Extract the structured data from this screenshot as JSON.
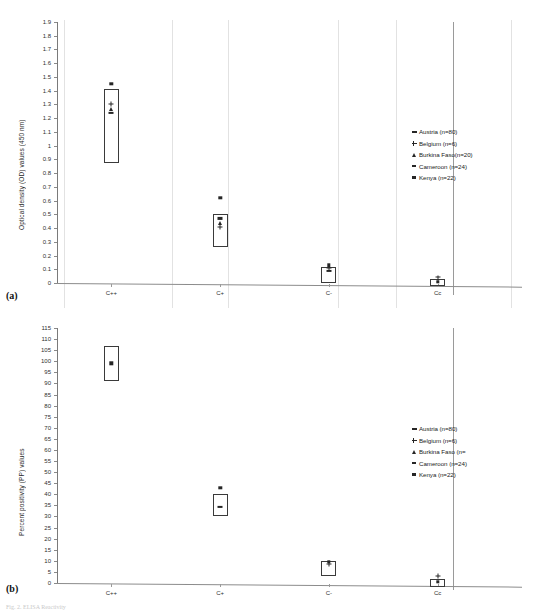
{
  "document": {
    "page_header": "",
    "caption": "Fig. 2. ELISA Reactivity"
  },
  "legend": {
    "entries": [
      {
        "label": "Austria (n=80)",
        "marker": "dash-bold",
        "marker_name": "austria-marker-icon"
      },
      {
        "label": "Belgium (n=6)",
        "marker": "plus",
        "marker_name": "belgium-marker-icon"
      },
      {
        "label": "Burkina Faso(n=20)",
        "marker": "triangle",
        "marker_name": "burkina-faso-marker-icon"
      },
      {
        "label": "Cameroon (n=24)",
        "marker": "dash",
        "marker_name": "cameroon-marker-icon"
      },
      {
        "label": "Kenya (n=22)",
        "marker": "square",
        "marker_name": "kenya-marker-icon"
      }
    ],
    "entries_b": [
      {
        "label": "Austria (n=80)",
        "marker": "dash-bold",
        "marker_name": "austria-marker-icon"
      },
      {
        "label": "Belgium (n=6)",
        "marker": "plus",
        "marker_name": "belgium-marker-icon"
      },
      {
        "label": "Burkina Faso (n=",
        "marker": "triangle",
        "marker_name": "burkina-faso-marker-icon"
      },
      {
        "label": "Cameroon (n=24)",
        "marker": "dash",
        "marker_name": "cameroon-marker-icon"
      },
      {
        "label": "Kenya (n=22)",
        "marker": "square",
        "marker_name": "kenya-marker-icon"
      }
    ]
  },
  "panel_a": {
    "letter": "(a)",
    "ylabel": "Optical density (OD) values (450 nm)"
  },
  "panel_b": {
    "letter": "(b)",
    "ylabel": "Percent positivity (PP) values"
  },
  "chart_data": [
    {
      "type": "box",
      "panel": "(a)",
      "title": "",
      "xlabel": "",
      "ylabel": "Optical density (OD) values (450 nm)",
      "categories": [
        "C++",
        "C+",
        "C-",
        "Cc"
      ],
      "ylim": [
        0,
        1.9
      ],
      "ytick_step": 0.1,
      "yticks": [
        0,
        0.1,
        0.2,
        0.3,
        0.4,
        0.5,
        0.6,
        0.7,
        0.8,
        0.9,
        1,
        1.1,
        1.2,
        1.3,
        1.4,
        1.5,
        1.6,
        1.7,
        1.8,
        1.9
      ],
      "grid": "vertical-only",
      "legend_position": "right",
      "boxes": [
        {
          "category": "C++",
          "low": 0.87,
          "high": 1.41
        },
        {
          "category": "C+",
          "low": 0.26,
          "high": 0.5
        },
        {
          "category": "C-",
          "low": 0.0,
          "high": 0.12
        },
        {
          "category": "Cc",
          "low": -0.02,
          "high": 0.03
        }
      ],
      "points": [
        {
          "category": "C++",
          "series": "Kenya (n=22)",
          "marker": "square",
          "value": 1.45
        },
        {
          "category": "C++",
          "series": "Belgium (n=6)",
          "marker": "plus",
          "value": 1.3
        },
        {
          "category": "C++",
          "series": "Burkina Faso(n=20)",
          "marker": "triangle",
          "value": 1.27
        },
        {
          "category": "C++",
          "series": "Austria (n=80)",
          "marker": "dash-bold",
          "value": 1.24
        },
        {
          "category": "C+",
          "series": "Kenya (n=22)",
          "marker": "square",
          "value": 0.62
        },
        {
          "category": "C+",
          "series": "Austria (n=80)",
          "marker": "dash-bold",
          "value": 0.47
        },
        {
          "category": "C+",
          "series": "Burkina Faso(n=20)",
          "marker": "triangle",
          "value": 0.44
        },
        {
          "category": "C+",
          "series": "Belgium (n=6)",
          "marker": "plus",
          "value": 0.41
        },
        {
          "category": "C-",
          "series": "Kenya (n=22)",
          "marker": "square",
          "value": 0.13
        },
        {
          "category": "C-",
          "series": "Belgium (n=6)",
          "marker": "plus",
          "value": 0.11
        },
        {
          "category": "C-",
          "series": "Austria (n=80)",
          "marker": "dash-bold",
          "value": 0.09
        },
        {
          "category": "Cc",
          "series": "Belgium (n=6)",
          "marker": "plus",
          "value": 0.04
        },
        {
          "category": "Cc",
          "series": "Kenya (n=22)",
          "marker": "square",
          "value": 0.01
        }
      ]
    },
    {
      "type": "box",
      "panel": "(b)",
      "title": "",
      "xlabel": "",
      "ylabel": "Percent positivity (PP) values",
      "categories": [
        "C++",
        "C+",
        "C-",
        "Cc"
      ],
      "ylim": [
        0,
        115
      ],
      "ytick_step": 5,
      "yticks": [
        0,
        5,
        10,
        15,
        20,
        25,
        30,
        35,
        40,
        45,
        50,
        55,
        60,
        65,
        70,
        75,
        80,
        85,
        90,
        95,
        100,
        105,
        110,
        115
      ],
      "grid": "none",
      "legend_position": "right",
      "boxes": [
        {
          "category": "C++",
          "low": 91,
          "high": 107
        },
        {
          "category": "C+",
          "low": 30,
          "high": 40
        },
        {
          "category": "C-",
          "low": 3,
          "high": 10
        },
        {
          "category": "Cc",
          "low": -2,
          "high": 2
        }
      ],
      "points": [
        {
          "category": "C++",
          "series": "Kenya (n=22)",
          "marker": "square",
          "value": 99
        },
        {
          "category": "C+",
          "series": "Kenya (n=22)",
          "marker": "square",
          "value": 43
        },
        {
          "category": "C+",
          "series": "Austria (n=80)",
          "marker": "dash-bold",
          "value": 34.5
        },
        {
          "category": "C-",
          "series": "Kenya (n=22)",
          "marker": "square",
          "value": 9.5
        },
        {
          "category": "C-",
          "series": "Belgium (n=6)",
          "marker": "plus",
          "value": 8.5
        },
        {
          "category": "Cc",
          "series": "Belgium (n=6)",
          "marker": "plus",
          "value": 3
        },
        {
          "category": "Cc",
          "series": "Kenya (n=22)",
          "marker": "square",
          "value": 0.5
        }
      ]
    }
  ]
}
